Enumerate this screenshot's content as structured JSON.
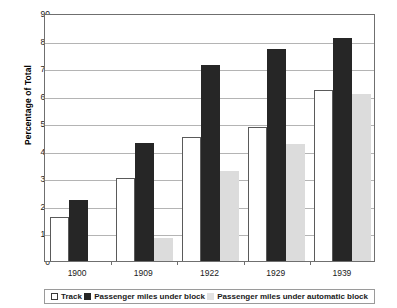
{
  "chart_data": {
    "type": "bar",
    "title": "",
    "xlabel": "",
    "ylabel": "Percentage of Total",
    "ylim": [
      0,
      90
    ],
    "ytick_step": 10,
    "yticks": [
      90,
      80,
      70,
      60,
      50,
      40,
      30,
      20,
      10,
      0
    ],
    "grid": true,
    "legend_position": "bottom",
    "categories": [
      "1900",
      "1909",
      "1922",
      "1929",
      "1939"
    ],
    "series": [
      {
        "name": "Track",
        "color": "#ffffff",
        "values": [
          16,
          30,
          45,
          48.5,
          62
        ]
      },
      {
        "name": "Passenger miles under block",
        "color": "#262626",
        "values": [
          22,
          43,
          71,
          77,
          81
        ]
      },
      {
        "name": "Passenger miles under automatic block",
        "color": "#dcdcdc",
        "values": [
          0,
          8.5,
          32.5,
          42.5,
          60.5
        ]
      }
    ]
  },
  "axis": {
    "y_title": "Percentage of Total"
  },
  "legend": {
    "items": [
      {
        "label": "Track",
        "swatch": "track-swatch"
      },
      {
        "label": "Passenger miles under block",
        "swatch": "block-swatch"
      },
      {
        "label": "Passenger miles under automatic block",
        "swatch": "automatic-block-swatch"
      }
    ]
  }
}
